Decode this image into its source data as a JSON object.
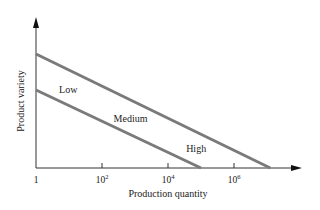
{
  "chart_data": {
    "type": "line",
    "title": "",
    "xlabel": "Production quantity",
    "ylabel": "Product variety",
    "x_scale": "log10",
    "x_ticks": [
      {
        "base": "1",
        "exp": ""
      },
      {
        "base": "10",
        "exp": "2"
      },
      {
        "base": "10",
        "exp": "4"
      },
      {
        "base": "10",
        "exp": "6"
      }
    ],
    "x_tick_exponents": [
      0,
      2,
      4,
      6
    ],
    "xlim_log10": [
      0,
      7.8
    ],
    "ylim": [
      0,
      1
    ],
    "grid": false,
    "series": [
      {
        "name": "Upper boundary",
        "points": [
          [
            0,
            0.76
          ],
          [
            7.1,
            0
          ]
        ]
      },
      {
        "name": "Lower boundary",
        "points": [
          [
            0,
            0.52
          ],
          [
            5.0,
            0
          ]
        ]
      }
    ],
    "region_labels": [
      {
        "text": "Low",
        "x_log10": 0.7,
        "y": 0.52
      },
      {
        "text": "Medium",
        "x_log10": 2.35,
        "y": 0.33
      },
      {
        "text": "High",
        "x_log10": 4.55,
        "y": 0.13
      }
    ],
    "line_color": "#7a7a7a",
    "axis_color": "#333333"
  }
}
